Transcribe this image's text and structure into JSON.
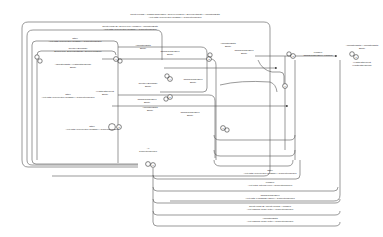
{
  "diagram": {
    "type": "state-machine",
    "states": [
      {
        "id": "0",
        "label": "0"
      },
      {
        "id": "1",
        "label": "1"
      },
      {
        "id": "2",
        "label": "2"
      },
      {
        "id": "3",
        "label": "3"
      },
      {
        "id": "4",
        "label": "4"
      },
      {
        "id": "5",
        "label": "5"
      },
      {
        "id": "6",
        "label": "6"
      },
      {
        "id": "7",
        "label": "7"
      },
      {
        "id": "8",
        "label": "8"
      },
      {
        "id": "9",
        "label": "9"
      }
    ],
    "labels": {
      "top1a": "ClientHelloRSA / ChangeCipherSpec | ServerHelloDone | ServerCertificate | ApplicationData",
      "top1b": "Alert Fatal (Unexpected message) / ConnectionClosed",
      "top2a": "ClientHelloDHE / ServerHello | Finished | ApplicationData",
      "top2b": "Alert Fatal (Unexpected message) / ConnectionClosed",
      "top3a": "Other",
      "top3b": "Alert Fatal (Unexpected message) / ConnectionClosed",
      "t_left1a": "ClientKeyExchange",
      "t_left1b": "ServerHello, ServerCertificate | ServerHelloDone",
      "t_left2a": "ApplicationData / HeartbeatResponse",
      "t_left2b": "Empty",
      "t_mid1a": "ApplicationData",
      "t_mid1b": "Empty",
      "t_mid2a": "ChangeCipherSpec",
      "t_mid2b": "Empty",
      "t_r1a": "ApplicationData",
      "t_r1b": "Empty",
      "t_r2a": "ChangeCipherSpec",
      "t_r2b": "Empty",
      "t_fin_a": "Finished",
      "t_fin_b": "ChangeCipherSpec | Finished",
      "t_far1a": "ApplicationData / ApplicationData",
      "t_far1b": "Empty",
      "t_far2a": "HeartbeatRequest",
      "t_far2b": "HeartbeatResponse",
      "t_other_a": "Other",
      "t_other_b": "Alert Fatal (Unexpected message) / ConnectionClosed",
      "t_hb_a": "HeartbeatRequest",
      "t_hb_b": "Empty",
      "t_cke_a": "ClientKeyExchange",
      "t_cke_b": "Empty",
      "t_ccs_a": "ChangeCipherSpec",
      "t_ccs_b": "Empty",
      "t_ad_a": "ApplicationData",
      "t_ad_b": "Empty",
      "t_bot1a": "Other",
      "t_bot1b": "Alert Fatal (Unexpected message) / ConnectionClosed",
      "t_bot2a": "Finished",
      "t_bot2b": "Alert Fatal (Internal error) / ConnectionClosed",
      "t_bot3a": "ChangeCipherSpec",
      "t_bot3b": "Alert Fatal (Handshake failure) / ConnectionClosed",
      "t_bot4a": "ClientHelloDHE | ClientHelloRSA | Finished",
      "t_bot4b": "Alert Warning (Close notify) / ConnectionClosed",
      "t_bot5a": "ApplicationData",
      "t_bot5b": "Alert Warning (Close notify) / ConnectionClosed",
      "t_init_a": "All",
      "t_init_b": "ConnectionClosed",
      "t_alert_a": "Other",
      "t_alert_b": "Alert Fatal (Unexpected message) / ConnectionClosed",
      "t_mid3a": "ChangeCipherSpec",
      "t_mid3b": "Empty",
      "t_mid4a": "ChangeCipherSpec",
      "t_mid4b": "Empty"
    }
  }
}
